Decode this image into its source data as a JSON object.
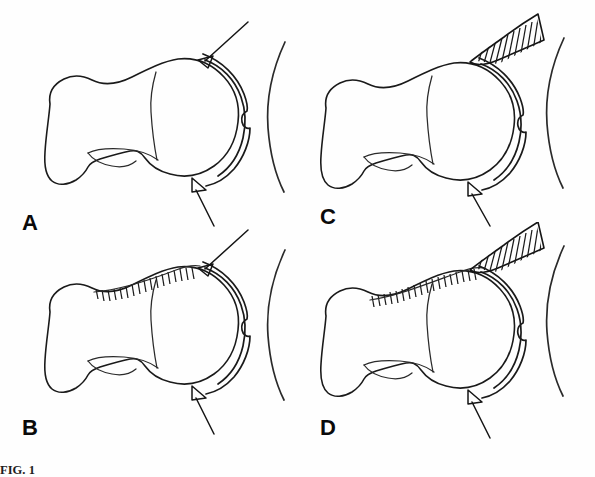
{
  "figure": {
    "type": "anatomical-line-drawing",
    "background_color": "#fefefe",
    "line_color": "#1a1a1a",
    "panel_count": 4,
    "caption_prefix": "FIG. 1",
    "caption_text": "FIG. 1",
    "caption_truncated": true
  },
  "panels": [
    {
      "id": "a",
      "label": "A",
      "position": "top-left",
      "has_neck_hatching": false,
      "has_external_wedge": false,
      "has_superior_pointer": true,
      "has_inferior_pointer": true,
      "has_pelvic_arc": true
    },
    {
      "id": "c",
      "label": "C",
      "position": "top-right",
      "has_neck_hatching": false,
      "has_external_wedge": true,
      "has_superior_pointer": false,
      "has_inferior_pointer": true,
      "has_pelvic_arc": true
    },
    {
      "id": "b",
      "label": "B",
      "position": "bottom-left",
      "has_neck_hatching": true,
      "has_external_wedge": false,
      "has_superior_pointer": true,
      "has_inferior_pointer": true,
      "has_pelvic_arc": true
    },
    {
      "id": "d",
      "label": "D",
      "position": "bottom-right",
      "has_neck_hatching": true,
      "has_external_wedge": true,
      "has_superior_pointer": false,
      "has_inferior_pointer": true,
      "has_pelvic_arc": true
    }
  ]
}
